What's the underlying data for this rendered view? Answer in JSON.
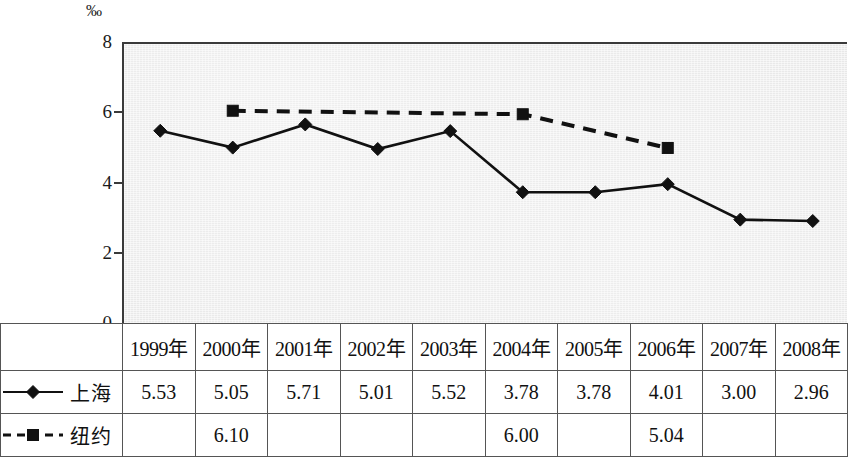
{
  "chart_data": {
    "type": "line",
    "title": "",
    "xlabel": "",
    "ylabel": "‰",
    "unit_symbol": "‰",
    "ylim": [
      0,
      8
    ],
    "y_ticks": [
      0,
      2,
      4,
      6,
      8
    ],
    "y_tick_labels": [
      "0",
      "2",
      "4",
      "6",
      "8"
    ],
    "grid": false,
    "legend_position": "table-row-header",
    "categories": [
      "1999年",
      "2000年",
      "2001年",
      "2002年",
      "2003年",
      "2004年",
      "2005年",
      "2006年",
      "2007年",
      "2008年"
    ],
    "series": [
      {
        "name": "上海",
        "marker": "diamond",
        "line_style": "solid",
        "color": "#111111",
        "values": [
          5.53,
          5.05,
          5.71,
          5.01,
          5.52,
          3.78,
          3.78,
          4.01,
          3.0,
          2.96
        ],
        "value_labels": [
          "5.53",
          "5.05",
          "5.71",
          "5.01",
          "5.52",
          "3.78",
          "3.78",
          "4.01",
          "3.00",
          "2.96"
        ]
      },
      {
        "name": "纽约",
        "marker": "square",
        "line_style": "dashed",
        "color": "#111111",
        "values": [
          null,
          6.1,
          null,
          null,
          null,
          6.0,
          null,
          5.04,
          null,
          null
        ],
        "value_labels": [
          "",
          "6.10",
          "",
          "",
          "",
          "6.00",
          "",
          "5.04",
          "",
          ""
        ]
      }
    ]
  },
  "table": {
    "header": {
      "legend_cell": "",
      "years": [
        "1999年",
        "2000年",
        "2001年",
        "2002年",
        "2003年",
        "2004年",
        "2005年",
        "2006年",
        "2007年",
        "2008年"
      ]
    },
    "rows": [
      {
        "series_name": "上海",
        "marker": "diamond",
        "line_style": "solid",
        "values": [
          "5.53",
          "5.05",
          "5.71",
          "5.01",
          "5.52",
          "3.78",
          "3.78",
          "4.01",
          "3.00",
          "2.96"
        ]
      },
      {
        "series_name": "纽约",
        "marker": "square",
        "line_style": "dashed",
        "values": [
          "",
          "6.10",
          "",
          "",
          "",
          "6.00",
          "",
          "5.04",
          "",
          ""
        ]
      }
    ]
  },
  "colors": {
    "ink": "#111111",
    "axis": "#3a3a3a",
    "plot_background": "#ececec",
    "grid_border": "#555555",
    "page_background": "#ffffff"
  }
}
